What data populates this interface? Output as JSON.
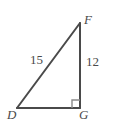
{
  "figure": {
    "type": "right-triangle-diagram",
    "background_color": "#ffffff",
    "stroke_color": "#4a4a4a",
    "text_color": "#4a4a4a",
    "stroke_width": 2,
    "vertices": [
      {
        "name": "F",
        "label": "F",
        "x": 80,
        "y": 23,
        "position": "top-right"
      },
      {
        "name": "D",
        "label": "D",
        "x": 17,
        "y": 108,
        "position": "bottom-left"
      },
      {
        "name": "G",
        "label": "G",
        "x": 80,
        "y": 108,
        "position": "bottom-right"
      }
    ],
    "sides": [
      {
        "name": "DF",
        "label": "15",
        "role": "hypotenuse",
        "from": "D",
        "to": "F"
      },
      {
        "name": "FG",
        "label": "12",
        "role": "leg-vertical",
        "from": "F",
        "to": "G"
      },
      {
        "name": "DG",
        "label": "",
        "role": "leg-horizontal",
        "from": "D",
        "to": "G"
      }
    ],
    "right_angle": {
      "at_vertex": "G",
      "marker": "square",
      "size": 8
    }
  }
}
